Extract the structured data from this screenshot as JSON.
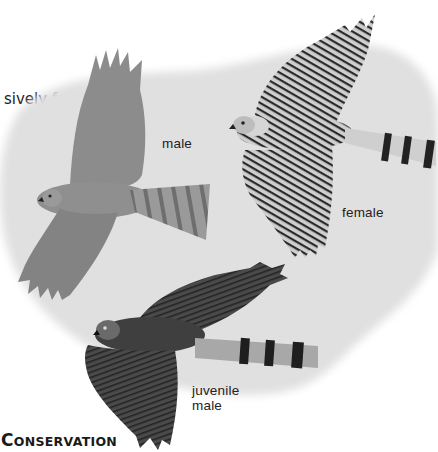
{
  "body_text": {
    "line_fragment_above": "hedgerows, woodland edges, and inten-",
    "line": "sively farmed arable areas."
  },
  "illustration": {
    "background_color": "#e2e2e2",
    "labels": {
      "male": "male",
      "female": "female",
      "juvenile_line1": "juvenile",
      "juvenile_line2": "male"
    }
  },
  "section_heading": {
    "first_letter": "C",
    "rest": "ONSERVATION"
  }
}
